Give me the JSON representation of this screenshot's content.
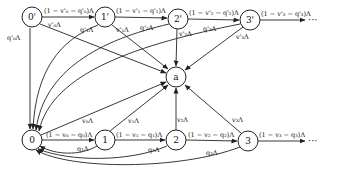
{
  "diagram": {
    "type": "state-transition",
    "nodes": {
      "n0p": {
        "label": "0'"
      },
      "n1p": {
        "label": "1'"
      },
      "n2p": {
        "label": "2'"
      },
      "n3p": {
        "label": "3'"
      },
      "a": {
        "label": "a"
      },
      "n0": {
        "label": "0"
      },
      "n1": {
        "label": "1"
      },
      "n2": {
        "label": "2"
      },
      "n3": {
        "label": "3"
      }
    },
    "edge_labels": {
      "top_0p_1p": "(1 − v'₀ − q'₀)Λ",
      "top_1p_2p": "(1 − v'₁ − q'₁)Λ",
      "top_2p_3p": "(1 − v'₂ − q'₂)Λ",
      "top_3p_out": "(1 − v'₃ − q'₃)Λ",
      "v0p": "v'₀Λ",
      "v1p": "v'₁Λ",
      "v2p": "v'₂Λ",
      "v3p": "v'₃Λ",
      "q0p": "q'₀Λ",
      "q1p": "q'₁Λ",
      "q2p": "q'₂Λ",
      "q3p": "q'₃Λ",
      "bot_0_1": "(1 − v₀ − q₀)Λ",
      "bot_1_2": "(1 − v₁ − q₁)Λ",
      "bot_2_3": "(1 − v₂ − q₂)Λ",
      "bot_3_out": "(1 − v₃ − q₃)Λ",
      "v0": "v₀Λ",
      "v1": "v₁Λ",
      "v2": "v₂Λ",
      "v3": "v₃Λ",
      "q1": "q₁Λ",
      "q2": "q₂Λ",
      "q3": "q₃Λ"
    },
    "ellipsis": "···"
  }
}
